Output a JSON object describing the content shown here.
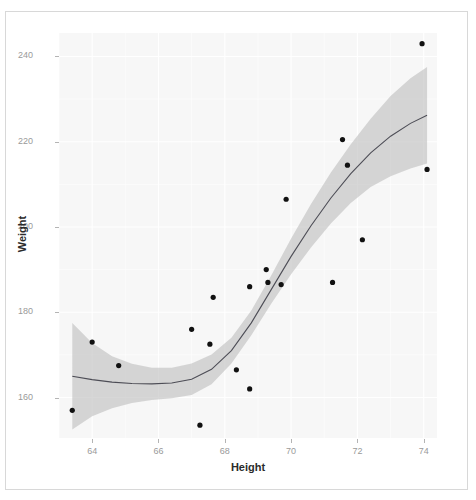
{
  "figure": {
    "background": "#ffffff",
    "panel_background": "#f7f7f7",
    "frame_border_color": "#d8d8d8"
  },
  "axes": {
    "x_title": "Height",
    "y_title": "Weight",
    "x_ticks": [
      "64",
      "66",
      "68",
      "70",
      "72",
      "74"
    ],
    "y_ticks": [
      "160",
      "180",
      "200",
      "220",
      "240"
    ],
    "tick_color": "#9a9a9a",
    "title_color": "#2b2b2b"
  },
  "chart_data": {
    "type": "scatter",
    "title": "",
    "xlabel": "Height",
    "ylabel": "Weight",
    "xlim": [
      63.0,
      74.4
    ],
    "ylim": [
      150.5,
      245.5
    ],
    "xticks": [
      64,
      66,
      68,
      70,
      72,
      74
    ],
    "yticks": [
      160,
      180,
      200,
      220,
      240
    ],
    "grid": true,
    "legend": "none",
    "point_color": "#111111",
    "line_color": "#4d4d56",
    "ribbon_color": "#bfbfbf",
    "points": [
      {
        "x": 63.4,
        "y": 157.0
      },
      {
        "x": 64.0,
        "y": 173.0
      },
      {
        "x": 64.8,
        "y": 167.5
      },
      {
        "x": 67.0,
        "y": 176.0
      },
      {
        "x": 67.25,
        "y": 153.5
      },
      {
        "x": 67.55,
        "y": 172.5
      },
      {
        "x": 67.65,
        "y": 183.5
      },
      {
        "x": 68.35,
        "y": 166.5
      },
      {
        "x": 68.75,
        "y": 162.0
      },
      {
        "x": 68.75,
        "y": 186.0
      },
      {
        "x": 69.25,
        "y": 190.0
      },
      {
        "x": 69.3,
        "y": 187.0
      },
      {
        "x": 69.7,
        "y": 186.5
      },
      {
        "x": 69.85,
        "y": 206.5
      },
      {
        "x": 71.25,
        "y": 187.0
      },
      {
        "x": 71.55,
        "y": 220.5
      },
      {
        "x": 71.7,
        "y": 214.5
      },
      {
        "x": 72.15,
        "y": 197.0
      },
      {
        "x": 73.95,
        "y": 243.0
      },
      {
        "x": 74.1,
        "y": 213.5
      }
    ],
    "smooth_fit": {
      "x": [
        63.4,
        64.0,
        64.6,
        65.2,
        65.8,
        66.4,
        67.0,
        67.6,
        68.2,
        68.8,
        69.4,
        70.0,
        70.6,
        71.2,
        71.8,
        72.4,
        73.0,
        73.6,
        74.1
      ],
      "y": [
        165.0,
        164.2,
        163.6,
        163.3,
        163.2,
        163.4,
        164.3,
        166.6,
        171.0,
        177.5,
        185.3,
        193.1,
        200.3,
        206.8,
        212.5,
        217.4,
        221.3,
        224.3,
        226.2
      ],
      "upper": [
        177.5,
        172.8,
        169.7,
        167.9,
        167.0,
        167.0,
        168.0,
        170.1,
        174.0,
        180.4,
        188.6,
        197.3,
        205.4,
        212.8,
        219.4,
        225.4,
        230.7,
        234.9,
        237.5
      ],
      "lower": [
        152.5,
        155.6,
        157.5,
        158.7,
        159.4,
        159.8,
        160.6,
        163.1,
        168.0,
        174.6,
        182.0,
        188.9,
        195.2,
        200.8,
        205.6,
        209.4,
        211.9,
        213.7,
        214.9
      ]
    }
  }
}
